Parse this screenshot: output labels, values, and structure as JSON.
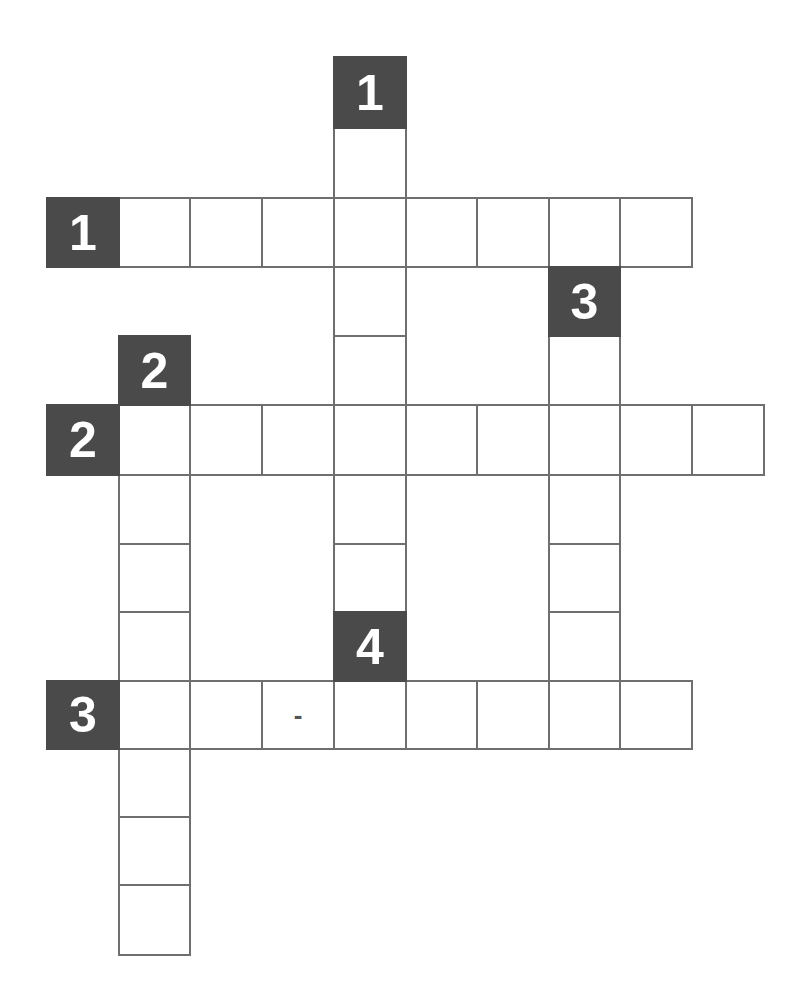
{
  "puzzle": {
    "type": "crossword",
    "colors": {
      "clue_cell_bg": "#4a4a4a",
      "clue_number": "#ffffff",
      "cell_bg": "#ffffff",
      "cell_border": "#6f6f6f"
    },
    "geometry": {
      "col_x": [
        47,
        119,
        190,
        262,
        334,
        406,
        477,
        549,
        620,
        692
      ],
      "row_y": [
        57,
        128,
        198,
        267,
        336,
        405,
        475,
        544,
        612,
        681,
        749,
        817,
        885
      ],
      "cell_w": 72,
      "cell_h": 70
    },
    "clue_cells": [
      {
        "id": "down-1",
        "number": "1",
        "direction": "down",
        "row": 0,
        "col": 4
      },
      {
        "id": "across-1",
        "number": "1",
        "direction": "across",
        "row": 2,
        "col": 0
      },
      {
        "id": "down-3",
        "number": "3",
        "direction": "down",
        "row": 3,
        "col": 7
      },
      {
        "id": "down-2",
        "number": "2",
        "direction": "down",
        "row": 4,
        "col": 1
      },
      {
        "id": "across-2",
        "number": "2",
        "direction": "across",
        "row": 5,
        "col": 0
      },
      {
        "id": "down-4",
        "number": "4",
        "direction": "down",
        "row": 8,
        "col": 4
      },
      {
        "id": "across-3",
        "number": "3",
        "direction": "across",
        "row": 9,
        "col": 0
      }
    ],
    "answer_cells": [
      {
        "row": 1,
        "col": 4,
        "value": ""
      },
      {
        "row": 2,
        "col": 1,
        "value": ""
      },
      {
        "row": 2,
        "col": 2,
        "value": ""
      },
      {
        "row": 2,
        "col": 3,
        "value": ""
      },
      {
        "row": 2,
        "col": 4,
        "value": ""
      },
      {
        "row": 2,
        "col": 5,
        "value": ""
      },
      {
        "row": 2,
        "col": 6,
        "value": ""
      },
      {
        "row": 2,
        "col": 7,
        "value": ""
      },
      {
        "row": 2,
        "col": 8,
        "value": ""
      },
      {
        "row": 3,
        "col": 4,
        "value": ""
      },
      {
        "row": 4,
        "col": 4,
        "value": ""
      },
      {
        "row": 4,
        "col": 7,
        "value": ""
      },
      {
        "row": 5,
        "col": 1,
        "value": ""
      },
      {
        "row": 5,
        "col": 2,
        "value": ""
      },
      {
        "row": 5,
        "col": 3,
        "value": ""
      },
      {
        "row": 5,
        "col": 4,
        "value": ""
      },
      {
        "row": 5,
        "col": 5,
        "value": ""
      },
      {
        "row": 5,
        "col": 6,
        "value": ""
      },
      {
        "row": 5,
        "col": 7,
        "value": ""
      },
      {
        "row": 5,
        "col": 8,
        "value": ""
      },
      {
        "row": 5,
        "col": 9,
        "value": ""
      },
      {
        "row": 6,
        "col": 1,
        "value": ""
      },
      {
        "row": 6,
        "col": 4,
        "value": ""
      },
      {
        "row": 6,
        "col": 7,
        "value": ""
      },
      {
        "row": 7,
        "col": 1,
        "value": ""
      },
      {
        "row": 7,
        "col": 4,
        "value": ""
      },
      {
        "row": 7,
        "col": 7,
        "value": ""
      },
      {
        "row": 8,
        "col": 1,
        "value": ""
      },
      {
        "row": 8,
        "col": 7,
        "value": ""
      },
      {
        "row": 9,
        "col": 1,
        "value": ""
      },
      {
        "row": 9,
        "col": 2,
        "value": ""
      },
      {
        "row": 9,
        "col": 3,
        "value": "-"
      },
      {
        "row": 9,
        "col": 4,
        "value": ""
      },
      {
        "row": 9,
        "col": 5,
        "value": ""
      },
      {
        "row": 9,
        "col": 6,
        "value": ""
      },
      {
        "row": 9,
        "col": 7,
        "value": ""
      },
      {
        "row": 9,
        "col": 8,
        "value": ""
      },
      {
        "row": 10,
        "col": 1,
        "value": ""
      },
      {
        "row": 11,
        "col": 1,
        "value": ""
      },
      {
        "row": 12,
        "col": 1,
        "value": ""
      }
    ]
  }
}
